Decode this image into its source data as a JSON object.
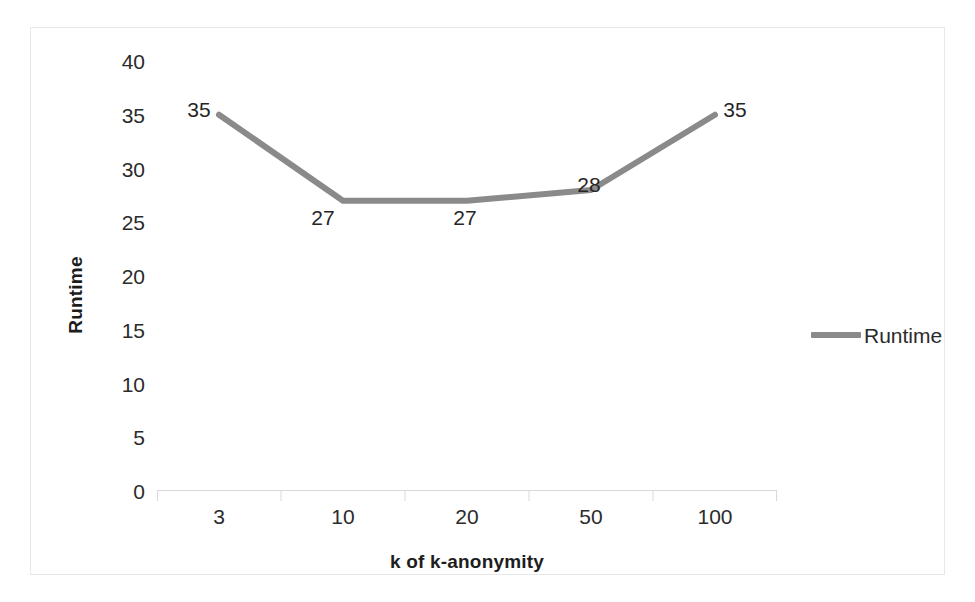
{
  "chart_data": {
    "type": "line",
    "title": "",
    "xlabel": "k of k-anonymity",
    "ylabel": "Runtime",
    "categories": [
      "3",
      "10",
      "20",
      "50",
      "100"
    ],
    "values": [
      35,
      27,
      27,
      28,
      35
    ],
    "data_labels": [
      "35",
      "27",
      "27",
      "28",
      "35"
    ],
    "series": [
      {
        "name": "Runtime",
        "values": [
          35,
          27,
          27,
          28,
          35
        ],
        "color": "#8a8a8a"
      }
    ],
    "ylim": [
      0,
      40
    ],
    "y_tick_step": 5,
    "y_ticks": [
      "40",
      "35",
      "30",
      "25",
      "20",
      "15",
      "10",
      "5",
      "0"
    ],
    "grid": false,
    "legend_position": "right",
    "legend_entries": [
      "Runtime"
    ],
    "axis_line_color": "#d9d9d9",
    "frame_color": "#e8e8e8",
    "text_color": "#2b2b2b"
  }
}
